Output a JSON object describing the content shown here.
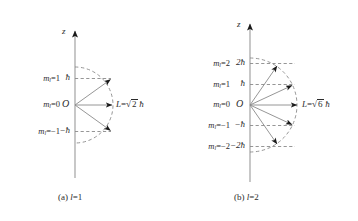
{
  "figure": {
    "panels": [
      {
        "id": "panel-a",
        "caption": "(a) l=1",
        "caption_prefix": "(a)",
        "caption_l": "l",
        "caption_value": "=1",
        "axis_label": "z",
        "origin_label": "O",
        "magnitude_label": "L=√2 ħ",
        "magnitude_L": "L",
        "magnitude_eq": "=",
        "magnitude_radicand": "2",
        "magnitude_hbar": "ħ",
        "l_value": 1,
        "L_magnitude_expr": "√2ħ",
        "states": [
          {
            "m_label": "m",
            "m_sub": "l",
            "m_eq": "=1",
            "m_value": 1,
            "tick": "ħ",
            "z_component": 1
          },
          {
            "m_label": "m",
            "m_sub": "l",
            "m_eq": "=0",
            "m_value": 0,
            "tick": "O",
            "z_component": 0
          },
          {
            "m_label": "m",
            "m_sub": "l",
            "m_eq": "=−1",
            "m_value": -1,
            "tick": "−ħ",
            "z_component": -1
          }
        ]
      },
      {
        "id": "panel-b",
        "caption": "(b) l=2",
        "caption_prefix": "(b)",
        "caption_l": "l",
        "caption_value": "=2",
        "axis_label": "z",
        "origin_label": "O",
        "magnitude_label": "L=√6 ħ",
        "magnitude_L": "L",
        "magnitude_eq": "=",
        "magnitude_radicand": "6",
        "magnitude_hbar": "ħ",
        "l_value": 2,
        "L_magnitude_expr": "√6ħ",
        "states": [
          {
            "m_label": "m",
            "m_sub": "l",
            "m_eq": "=2",
            "m_value": 2,
            "tick": "2ħ",
            "z_component": 2
          },
          {
            "m_label": "m",
            "m_sub": "l",
            "m_eq": "=1",
            "m_value": 1,
            "tick": "ħ",
            "z_component": 1
          },
          {
            "m_label": "m",
            "m_sub": "l",
            "m_eq": "=0",
            "m_value": 0,
            "tick": "O",
            "z_component": 0
          },
          {
            "m_label": "m",
            "m_sub": "l",
            "m_eq": "=−1",
            "m_value": -1,
            "tick": "−ħ",
            "z_component": -1
          },
          {
            "m_label": "m",
            "m_sub": "l",
            "m_eq": "=−2",
            "m_value": -2,
            "tick": "−2ħ",
            "z_component": -2
          }
        ]
      }
    ],
    "colors": {
      "stroke": "#8a8a8a",
      "dashed": "#8a8a8a",
      "arrowhead": "#1a1a1a",
      "text": "#2b2b2b",
      "background": "#ffffff"
    }
  }
}
